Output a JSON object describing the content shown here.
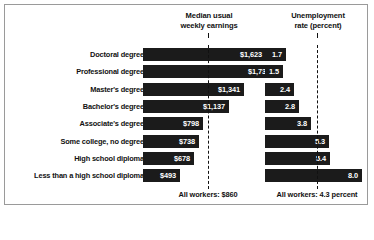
{
  "chart_data": {
    "type": "bar",
    "title": "",
    "categories": [
      "Doctoral degree",
      "Professional degree",
      "Master's degree",
      "Bachelor's degree",
      "Associate's degree",
      "Some college, no degree",
      "High school diploma",
      "Less than a high school diploma"
    ],
    "series": [
      {
        "name": "Median usual weekly earnings",
        "unit": "dollars",
        "values": [
          1623,
          1730,
          1341,
          1137,
          798,
          738,
          678,
          493
        ],
        "labels": [
          "$1,623",
          "$1,730",
          "$1,341",
          "$1,137",
          "$798",
          "$738",
          "$678",
          "$493"
        ],
        "reference_value": 860,
        "reference_label": "All workers: $860",
        "header": "Median usual weekly earnings",
        "xlim": [
          0,
          1730
        ]
      },
      {
        "name": "Unemployment rate (percent)",
        "unit": "percent",
        "values": [
          1.7,
          1.5,
          2.4,
          2.8,
          3.8,
          5.3,
          5.4,
          8.0
        ],
        "labels": [
          "1.7",
          "1.5",
          "2.4",
          "2.8",
          "3.8",
          "5.3",
          "5.4",
          "8.0"
        ],
        "reference_value": 4.3,
        "reference_label": "All workers: 4.3 percent",
        "header": "Unemployment rate (percent)",
        "xlim": [
          0,
          8.0
        ]
      }
    ],
    "xlabel": "",
    "ylabel": "",
    "grid": false,
    "legend": "none"
  },
  "headers": {
    "earnings_line1": "Median usual",
    "earnings_line2": "weekly earnings",
    "unemployment_line1": "Unemployment",
    "unemployment_line2": "rate (percent)"
  },
  "footers": {
    "earnings": "All workers: $860",
    "unemployment": "All workers: 4.3 percent"
  },
  "colors": {
    "bar": "#1b1b1b",
    "text": "#111111",
    "bar_text": "#ffffff",
    "frame": "#9a9a9a",
    "background": "#ffffff"
  }
}
